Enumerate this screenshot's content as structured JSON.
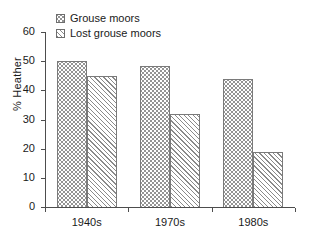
{
  "chart_data": {
    "type": "bar",
    "title": "",
    "subtitle": "",
    "xlabel": "",
    "ylabel": "% Heather",
    "categories": [
      "1940s",
      "1970s",
      "1980s"
    ],
    "series": [
      {
        "name": "Grouse moors",
        "fill": "dots",
        "values": [
          50,
          48.5,
          44
        ]
      },
      {
        "name": "Lost grouse moors",
        "fill": "hatch",
        "values": [
          45,
          32,
          19
        ]
      }
    ],
    "ylim": [
      0,
      60
    ],
    "ytick_values": [
      0,
      10,
      20,
      30,
      40,
      50,
      60
    ],
    "ytick_labels": [
      "0",
      "10",
      "20",
      "30",
      "40",
      "50",
      "60"
    ],
    "grid": false,
    "legend_position": "top-left-inside",
    "colors": {
      "axis": "#4d4d4d",
      "text": "#1a1a1a",
      "bar_outline": "#7a7a7a",
      "pattern": "#8c8c8c",
      "background": "#ffffff"
    }
  }
}
